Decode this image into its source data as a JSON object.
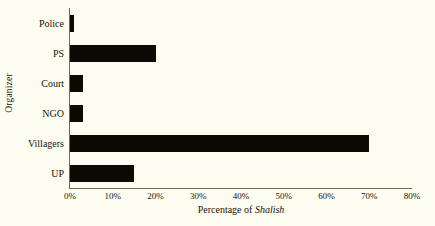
{
  "chart_data": {
    "type": "bar",
    "orientation": "horizontal",
    "title": "",
    "xlabel": "Percentage of Shalish",
    "xlabel_plain": "Percentage of ",
    "xlabel_italic": "Shalish",
    "ylabel": "Organizer",
    "categories": [
      "Police",
      "PS",
      "Court",
      "NGO",
      "Villagers",
      "UP"
    ],
    "values": [
      1,
      20,
      3,
      3,
      70,
      15
    ],
    "xlim": [
      0,
      80
    ],
    "xtick_labels": [
      "0%",
      "10%",
      "20%",
      "30%",
      "40%",
      "50%",
      "60%",
      "70%",
      "80%"
    ],
    "xtick_values": [
      0,
      10,
      20,
      30,
      40,
      50,
      60,
      70,
      80
    ],
    "grid": false,
    "legend": false,
    "bar_color": "#0c0a05",
    "background_color": "#fdfcf0",
    "axis_color": "#6f6a56"
  }
}
